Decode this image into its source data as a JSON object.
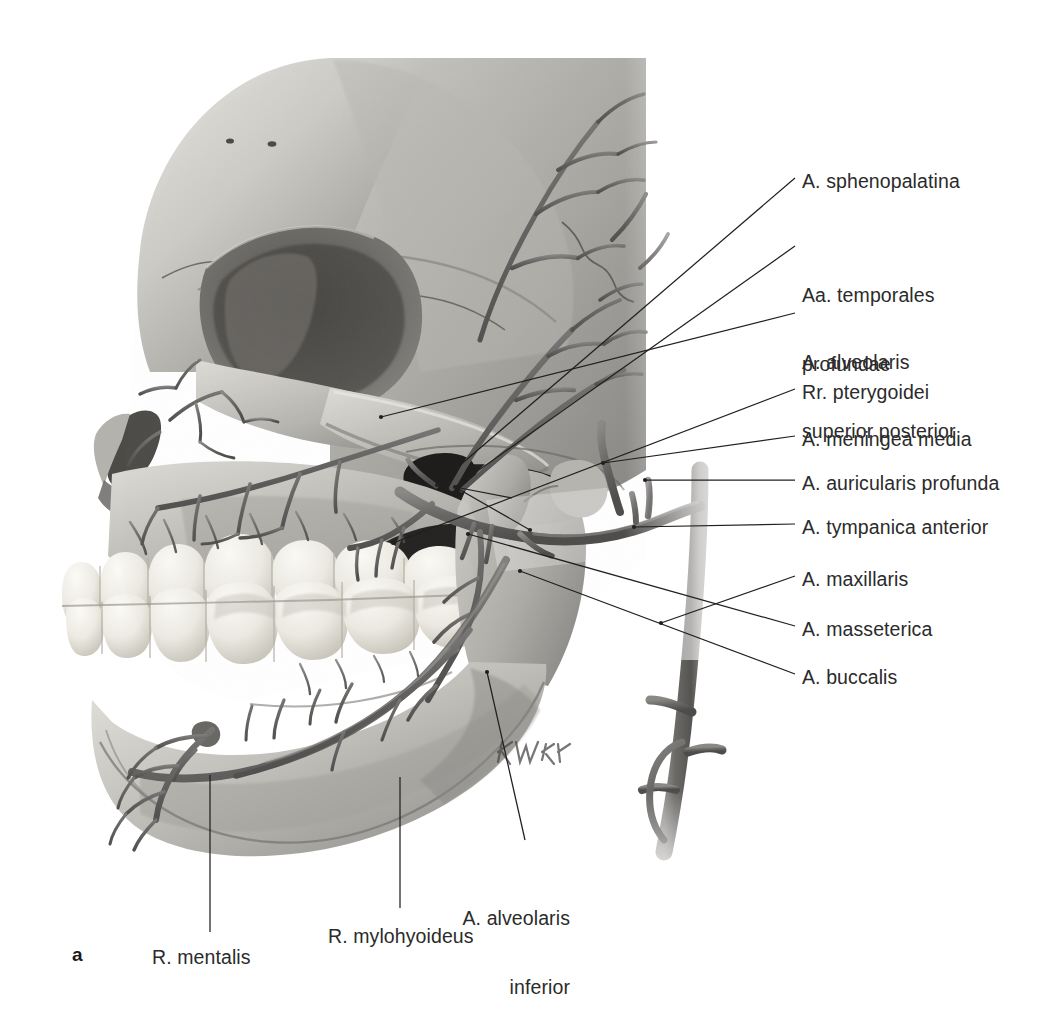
{
  "figure": {
    "letter": "a",
    "artist_signature": "K. Wesker",
    "style": "grayscale anatomical illustration"
  },
  "colors": {
    "bone_light": "#d8d6d2",
    "bone_mid": "#a8a6a2",
    "bone_shadow": "#7b7975",
    "bone_dark": "#4a4845",
    "cavity": "#201f1e",
    "artery": "#6e6c6a",
    "artery_dark": "#4c4a48",
    "tooth": "#f2f0ea",
    "tooth_shadow": "#c9c5bb",
    "leader": "#231f20",
    "text": "#2b2b2b",
    "background": "#ffffff"
  },
  "labels": [
    {
      "id": "a-sphenopalatina",
      "text": "A. sphenopalatina",
      "lines": [
        "A. sphenopalatina"
      ],
      "side": "right",
      "x": 802,
      "y": 170,
      "leader": [
        [
          795,
          178
        ],
        [
          437,
          485
        ]
      ]
    },
    {
      "id": "aa-temporales-profundae",
      "text": "Aa. temporales profundae",
      "lines": [
        "Aa. temporales",
        "profundae"
      ],
      "side": "right",
      "x": 802,
      "y": 238,
      "leader": [
        [
          795,
          246
        ],
        [
          455,
          487
        ]
      ]
    },
    {
      "id": "a-alveolaris-superior-post",
      "text": "A. alveolaris superior posterior",
      "lines": [
        "A. alveolaris",
        "superior posterior"
      ],
      "side": "right",
      "x": 802,
      "y": 305,
      "leader": [
        [
          795,
          313
        ],
        [
          381,
          417
        ]
      ]
    },
    {
      "id": "rr-pterygoidei",
      "text": "Rr. pterygoidei",
      "lines": [
        "Rr. pterygoidei"
      ],
      "side": "right",
      "x": 802,
      "y": 381,
      "leader": [
        [
          795,
          389
        ],
        [
          393,
          543
        ]
      ]
    },
    {
      "id": "a-meningea-media",
      "text": "A. meningea media",
      "lines": [
        "A. meningea media"
      ],
      "side": "right",
      "x": 802,
      "y": 428,
      "leader": [
        [
          795,
          436
        ],
        [
          603,
          463
        ]
      ]
    },
    {
      "id": "a-auricularis-profunda",
      "text": "A. auricularis profunda",
      "lines": [
        "A. auricularis profunda"
      ],
      "side": "right",
      "x": 802,
      "y": 472,
      "leader": [
        [
          795,
          480
        ],
        [
          645,
          480
        ]
      ]
    },
    {
      "id": "a-tympanica-anterior",
      "text": "A. tympanica anterior",
      "lines": [
        "A. tympanica anterior"
      ],
      "side": "right",
      "x": 802,
      "y": 516,
      "leader": [
        [
          795,
          524
        ],
        [
          634,
          527
        ]
      ]
    },
    {
      "id": "a-maxillaris",
      "text": "A. maxillaris",
      "lines": [
        "A. maxillaris"
      ],
      "side": "right",
      "x": 802,
      "y": 568,
      "leader": [
        [
          795,
          576
        ],
        [
          661,
          623
        ]
      ]
    },
    {
      "id": "a-masseterica",
      "text": "A. masseterica",
      "lines": [
        "A. masseterica"
      ],
      "side": "right",
      "x": 802,
      "y": 618,
      "leader": [
        [
          795,
          626
        ],
        [
          468,
          534
        ]
      ]
    },
    {
      "id": "a-buccalis",
      "text": "A. buccalis",
      "lines": [
        "A. buccalis"
      ],
      "side": "right",
      "x": 802,
      "y": 666,
      "leader": [
        [
          795,
          674
        ],
        [
          520,
          571
        ]
      ]
    },
    {
      "id": "a-alveolaris-inferior",
      "text": "A. alveolaris inferior",
      "lines": [
        "A. alveolaris",
        "inferior"
      ],
      "side": "center",
      "x": 478,
      "y": 861,
      "leader": [
        [
          525,
          840
        ],
        [
          487,
          672
        ]
      ]
    },
    {
      "id": "r-mylohyoideus",
      "text": "R. mylohyoideus",
      "lines": [
        "R. mylohyoideus"
      ],
      "side": "center",
      "x": 328,
      "y": 925,
      "leader": [
        [
          400,
          908
        ],
        [
          400,
          777
        ]
      ]
    },
    {
      "id": "r-mentalis",
      "text": "R. mentalis",
      "lines": [
        "R. mentalis"
      ],
      "side": "center",
      "x": 152,
      "y": 946,
      "leader": [
        [
          210,
          932
        ],
        [
          210,
          775
        ]
      ]
    }
  ]
}
